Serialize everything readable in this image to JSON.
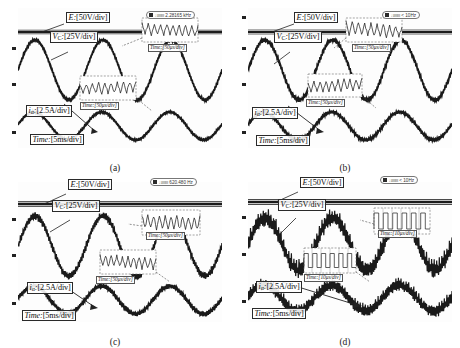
{
  "figure": {
    "background": "#ffffff",
    "trace_color": "#1a1a1a",
    "panel_count": 4
  },
  "labels": {
    "source_voltage": "E:",
    "source_voltage_scale": "[50V/div]",
    "cap_voltage": "V",
    "cap_voltage_sub": "C",
    "cap_voltage_colon": ":",
    "cap_voltage_scale": "[25V/div]",
    "current": "i",
    "current_sub": "α",
    "current_colon": ":",
    "current_scale": "[2.5A/div]",
    "time_base": "Time:",
    "time_base_scale": "[5ms/div]",
    "inset_50us": "Time:[50μs/div]",
    "inset_10us": "Time:[10μs/div]"
  },
  "panels": [
    {
      "id": "a",
      "caption": "(a)",
      "badge_trigger": "⎍ııııııı",
      "badge_value": "2.28165 kHz",
      "inset_timebase": "Time:[50μs/div]",
      "vc_ripple_amplitude": 1.0,
      "ia_ripple_amplitude": 0.8,
      "ripple_description": "smooth sinusoid, minimal switching ripple"
    },
    {
      "id": "b",
      "caption": "(b)",
      "badge_trigger": "⎍ııııııı",
      "badge_value": "< 10Hz",
      "inset_timebase": "Time:[50μs/div]",
      "vc_ripple_amplitude": 2.0,
      "ia_ripple_amplitude": 1.4,
      "ripple_description": "slight switching ripple on envelope"
    },
    {
      "id": "c",
      "caption": "(c)",
      "badge_trigger": "⎍ııııııı",
      "badge_value": "620.480 Hz",
      "inset_timebase": "Time:[50μs/div]",
      "vc_ripple_amplitude": 3.6,
      "ia_ripple_amplitude": 2.4,
      "ripple_description": "moderate high-frequency ripple superimposed"
    },
    {
      "id": "d",
      "caption": "(d)",
      "badge_trigger": "⎍ııııııı",
      "badge_value": "< 10Hz",
      "inset_timebase": "Time:[10μs/div]",
      "vc_ripple_amplitude": 9.0,
      "ia_ripple_amplitude": 6.5,
      "ripple_description": "large switching ripple dominating waveform"
    }
  ],
  "chart_data": {
    "type": "line",
    "xlabel": "Time",
    "ylabel": "Voltage / Current",
    "grid": false,
    "legend_position": "inline-annotations",
    "x_timebase": "5 ms/div",
    "inset_timebase_values": [
      "50 μs/div",
      "50 μs/div",
      "50 μs/div",
      "10 μs/div"
    ],
    "series": [
      {
        "name": "E",
        "scale": "50 V/div",
        "waveform": "dc-flat",
        "description": "DC source voltage, flat trace near top of screen",
        "values": [
          0,
          0,
          0,
          0,
          0,
          0,
          0,
          0,
          0,
          0
        ]
      },
      {
        "name": "V_C",
        "scale": "25 V/div",
        "waveform": "sinusoid",
        "cycles": 3,
        "amplitude_div": 1.45,
        "description": "Capacitor voltage, three sinusoidal cycles across 10 divisions",
        "values": [
          0,
          57,
          95,
          95,
          57,
          0,
          -57,
          -95,
          -95,
          -57,
          0
        ]
      },
      {
        "name": "i_alpha",
        "scale": "2.5 A/div",
        "waveform": "sinusoid",
        "cycles": 3,
        "amplitude_div": 0.72,
        "description": "Alpha-axis current, three sinusoidal cycles, smaller amplitude",
        "values": [
          0,
          1.06,
          1.8,
          1.8,
          1.06,
          0,
          -1.06,
          -1.8,
          -1.8,
          -1.06,
          0
        ]
      }
    ],
    "ripple_by_panel": {
      "a": {
        "vc_ripple_div": 0.05,
        "ia_ripple_div": 0.04
      },
      "b": {
        "vc_ripple_div": 0.1,
        "ia_ripple_div": 0.07
      },
      "c": {
        "vc_ripple_div": 0.18,
        "ia_ripple_div": 0.12
      },
      "d": {
        "vc_ripple_div": 0.45,
        "ia_ripple_div": 0.33
      }
    },
    "axis_ranges": {
      "x_divisions": 10,
      "y_divisions": 8
    }
  }
}
